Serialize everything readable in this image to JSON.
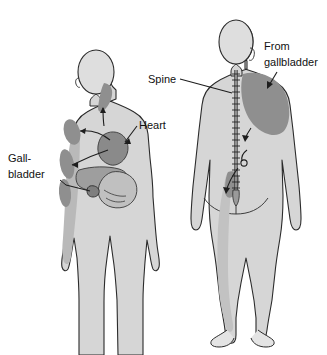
{
  "figure": {
    "type": "anatomical-diagram",
    "views": [
      {
        "id": "anterior",
        "name": "Anterior (front) view, upper body"
      },
      {
        "id": "posterior",
        "name": "Posterior (back) view, full body"
      }
    ]
  },
  "labels": {
    "gallbladder_line1": "Gall-",
    "gallbladder_line2": "bladder",
    "heart": "Heart",
    "spine": "Spine",
    "from_line1": "From",
    "from_line2": "gallbladder"
  },
  "icons": {
    "leader_line": "leader-line",
    "arrow": "arrow-head",
    "spine_column": "spine-column-icon"
  },
  "colors": {
    "page_background": "#ffffff",
    "body_fill": "#d6d6d6",
    "body_shade": "#c6c6c6",
    "outline": "#2b2b2b",
    "referred_pain_shade": "#8f8f8f",
    "organ_dark": "#8a8a8a",
    "organ_mid": "#9e9e9e",
    "organ_light": "#c0c0c0",
    "label_text": "#111111"
  },
  "regions": {
    "anterior": [
      {
        "name": "jaw-neck-referred-pain",
        "shade": "referred_pain_shade"
      },
      {
        "name": "left-shoulder-referred-pain",
        "shade": "referred_pain_shade"
      },
      {
        "name": "left-chest-referred-pain",
        "shade": "referred_pain_shade"
      },
      {
        "name": "left-arm-referred-pain",
        "shade": "referred_pain_shade"
      },
      {
        "name": "heart-organ",
        "shade": "organ_dark"
      },
      {
        "name": "liver-organ",
        "shade": "organ_mid"
      },
      {
        "name": "gallbladder-organ",
        "shade": "organ_dark"
      },
      {
        "name": "stomach-organ",
        "shade": "organ_light"
      }
    ],
    "posterior": [
      {
        "name": "right-scapula-referred-pain",
        "shade": "referred_pain_shade"
      },
      {
        "name": "spine-column",
        "shade": "outline"
      },
      {
        "name": "sacral-referred-pain",
        "shade": "referred_pain_shade"
      },
      {
        "name": "posterior-leg-referred-pain",
        "shade": "body_shade"
      }
    ]
  }
}
